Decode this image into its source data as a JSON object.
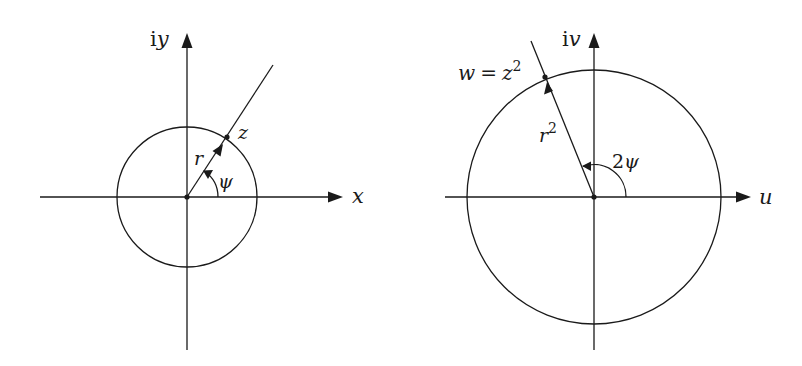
{
  "figure": {
    "left_panel": {
      "name": "z-plane",
      "axis_horizontal_label": "x",
      "axis_vertical_label_prefix": "i",
      "axis_vertical_label_var": "y",
      "point_label": "z",
      "radius_label": "r",
      "angle_label": "ψ",
      "geometry": {
        "origin": [
          187,
          197
        ],
        "circle_radius": 70,
        "ray_angle_deg": 56,
        "point": [
          227,
          139
        ],
        "ray_end": [
          273,
          65
        ],
        "angle_arc_radius": 31
      }
    },
    "right_panel": {
      "name": "w-plane",
      "axis_horizontal_label": "u",
      "axis_vertical_label_prefix": "i",
      "axis_vertical_label_var": "v",
      "point_label_lhs": "w",
      "point_label_eq": "=",
      "point_label_rhs": "z",
      "point_label_exp": "2",
      "radius_label": "r",
      "radius_label_exp": "2",
      "angle_label_coeff": "2",
      "angle_label": "ψ",
      "geometry": {
        "origin": [
          594,
          197
        ],
        "circle_radius": 127,
        "ray_angle_deg": 112,
        "point": [
          546,
          79
        ],
        "ray_end": [
          531,
          41
        ],
        "angle_arc_radius": 32
      }
    },
    "colors": {
      "ink": "#1a1a1a",
      "background": "#ffffff"
    }
  }
}
